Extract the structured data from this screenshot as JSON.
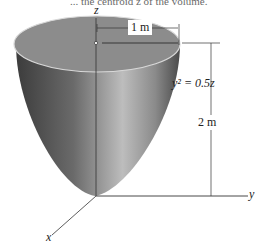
{
  "caption": "... the centroid z̄ of the volume.",
  "labels": {
    "z_axis": "z",
    "y_axis": "y",
    "x_axis": "x",
    "radius": "1 m",
    "height": "2 m",
    "equation": "y² = 0.5z"
  },
  "colors": {
    "top_face": "#8a8a8a",
    "body_dark": "#3c3c3c",
    "body_light": "#b4b4b4",
    "lines": "#333333"
  }
}
